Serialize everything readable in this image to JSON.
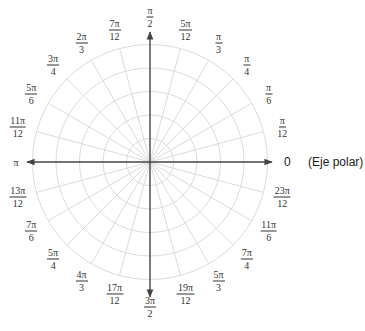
{
  "diagram": {
    "type": "polar-grid",
    "rings": 5,
    "angle_step": "π/12",
    "angles": [
      {
        "deg": 0,
        "num": "",
        "den": "",
        "label": "0"
      },
      {
        "deg": 15,
        "num": "π",
        "den": "12"
      },
      {
        "deg": 30,
        "num": "π",
        "den": "6"
      },
      {
        "deg": 45,
        "num": "π",
        "den": "4"
      },
      {
        "deg": 60,
        "num": "π",
        "den": "3"
      },
      {
        "deg": 75,
        "num": "5π",
        "den": "12"
      },
      {
        "deg": 90,
        "num": "π",
        "den": "2"
      },
      {
        "deg": 105,
        "num": "7π",
        "den": "12"
      },
      {
        "deg": 120,
        "num": "2π",
        "den": "3"
      },
      {
        "deg": 135,
        "num": "3π",
        "den": "4"
      },
      {
        "deg": 150,
        "num": "5π",
        "den": "6"
      },
      {
        "deg": 165,
        "num": "11π",
        "den": "12"
      },
      {
        "deg": 180,
        "num": "",
        "den": "",
        "label": "π"
      },
      {
        "deg": 195,
        "num": "13π",
        "den": "12"
      },
      {
        "deg": 210,
        "num": "7π",
        "den": "6"
      },
      {
        "deg": 225,
        "num": "5π",
        "den": "4"
      },
      {
        "deg": 240,
        "num": "4π",
        "den": "3"
      },
      {
        "deg": 255,
        "num": "17π",
        "den": "12"
      },
      {
        "deg": 270,
        "num": "3π",
        "den": "2"
      },
      {
        "deg": 285,
        "num": "19π",
        "den": "12"
      },
      {
        "deg": 300,
        "num": "5π",
        "den": "3"
      },
      {
        "deg": 315,
        "num": "7π",
        "den": "4"
      },
      {
        "deg": 330,
        "num": "11π",
        "den": "6"
      },
      {
        "deg": 345,
        "num": "23π",
        "den": "12"
      }
    ],
    "polar_axis_label": "(Eje polar)",
    "colors": {
      "grid": "#dcdcdc",
      "axis": "#444444",
      "text": "#333333"
    }
  }
}
